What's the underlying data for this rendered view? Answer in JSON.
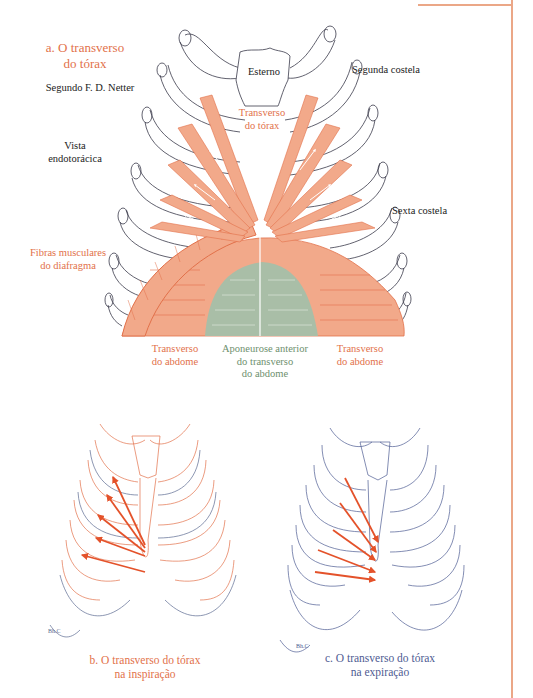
{
  "figure_a": {
    "title_line1": "a. O transverso",
    "title_line2": "do tórax",
    "credit": "Segundo F. D. Netter",
    "view_line1": "Vista",
    "view_line2": "endotorácica",
    "labels": {
      "sternum": "Esterno",
      "second_rib": "Segunda costela",
      "sixth_rib": "Sexta costela",
      "transversus_thoracis_line1": "Transverso",
      "transversus_thoracis_line2": "do tórax",
      "diaphragm_line1": "Fibras musculares",
      "diaphragm_line2": "do diafragma",
      "transversus_abdominis_left_line1": "Transverso",
      "transversus_abdominis_left_line2": "do abdome",
      "aponeurosis_line1": "Aponeurose anterior",
      "aponeurosis_line2": "do transverso",
      "aponeurosis_line3": "do abdome",
      "transversus_abdominis_right_line1": "Transverso",
      "transversus_abdominis_right_line2": "do abdome"
    }
  },
  "figure_b": {
    "caption_line1": "b. O transverso do tórax",
    "caption_line2": "na inspiração",
    "signature": "Bh.C"
  },
  "figure_c": {
    "caption_line1": "c. O transverso do tórax",
    "caption_line2": "na expiração",
    "signature": "Bh.C"
  },
  "colors": {
    "muscle": "#F2A98A",
    "muscle_stroke": "#E2714A",
    "aponeurosis": "#A9BEA7",
    "rib_outline": "#3A3A4A",
    "inspiration_outline": "#E2714A",
    "expiration_outline": "#4E5B92",
    "arrow": "#E4522A",
    "frame": "#EBA787"
  }
}
